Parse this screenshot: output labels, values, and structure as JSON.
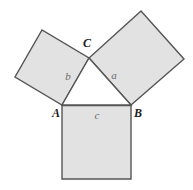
{
  "figure": {
    "name": "pythagorean-theorem-diagram",
    "background_color": "#ffffff",
    "square_fill": "#e2e2e2",
    "square_stroke": "#555555",
    "triangle_fill": "#ffffff",
    "triangle_stroke": "#555555",
    "side_label_color": "#6b6b6b",
    "vertex_label_color": "#1c1c1c",
    "stroke_width": 1.4
  },
  "vertices": {
    "A": {
      "label": "A",
      "x": 62,
      "y": 105,
      "label_x": 56,
      "label_y": 114
    },
    "B": {
      "label": "B",
      "x": 131,
      "y": 105,
      "label_x": 138,
      "label_y": 114
    },
    "C": {
      "label": "C",
      "x": 89,
      "y": 58,
      "label_x": 87,
      "label_y": 44
    }
  },
  "sides": {
    "a": {
      "label": "a",
      "label_x": 114,
      "label_y": 76,
      "opposite_vertex": "A"
    },
    "b": {
      "label": "b",
      "label_x": 68,
      "label_y": 77,
      "opposite_vertex": "B"
    },
    "c": {
      "label": "c",
      "label_x": 97,
      "label_y": 116,
      "opposite_vertex": "C"
    }
  },
  "triangle": {
    "name": "triangle-ABC",
    "points": "62,105 131,105 89,58"
  },
  "squares": [
    {
      "name": "square-on-side-c",
      "side": "c",
      "points": "62,105.5 131,105.5 131,179 62,179"
    },
    {
      "name": "square-on-side-b",
      "side": "b",
      "points": "62,105 89,58 42,30 15,77"
    },
    {
      "name": "square-on-side-a",
      "side": "a",
      "points": "89,58 131,105 184,59 141,11"
    }
  ]
}
